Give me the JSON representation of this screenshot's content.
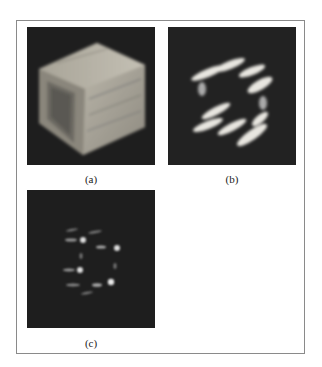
{
  "figure": {
    "panels": [
      {
        "id": "a",
        "caption": "(a)",
        "description": "Volume rendering of a hollow square tube (box) with wood-grain-like texture on dark background"
      },
      {
        "id": "b",
        "caption": "(b)",
        "description": "Streaked bright blobs outlining the tube shape on dark background"
      },
      {
        "id": "c",
        "caption": "(c)",
        "description": "Sparse small bright points outlining the tube shape on dark background"
      }
    ]
  }
}
